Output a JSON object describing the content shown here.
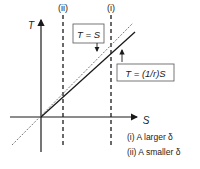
{
  "axes": {
    "y_label": "T",
    "x_label": "S"
  },
  "vlines": [
    {
      "id": "ii",
      "label": "(ii)"
    },
    {
      "id": "i",
      "label": "(i)"
    }
  ],
  "annotations": {
    "identity_line": "T = S",
    "scaled_line": "T = (1/r)S"
  },
  "legend": [
    "(i) A larger δ",
    "(ii) A smaller δ"
  ],
  "colors": {
    "line": "#1a1a1a",
    "dotted": "#777777",
    "background": "#ffffff"
  }
}
